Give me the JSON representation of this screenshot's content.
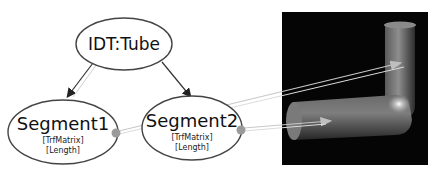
{
  "diagram": {
    "nodes": [
      {
        "id": "root",
        "title": "IDT:Tube",
        "fields": []
      },
      {
        "id": "seg1",
        "title": "Segment1",
        "fields": [
          "[TrfMatrix]",
          "[Length]"
        ]
      },
      {
        "id": "seg2",
        "title": "Segment2",
        "fields": [
          "[TrfMatrix]",
          "[Length]"
        ]
      }
    ],
    "edges": [
      {
        "from": "root",
        "to": "seg1"
      },
      {
        "from": "root",
        "to": "seg2"
      },
      {
        "from": "seg1",
        "to": "render-upper-segment"
      },
      {
        "from": "seg2",
        "to": "render-lower-segment"
      }
    ],
    "render": {
      "description": "3D rendered bent tube",
      "background": "#050505"
    },
    "colors": {
      "node_fill": "#ffffff",
      "node_stroke": "#444444",
      "edge": "#333333",
      "link": "#cfcfcf",
      "port": "#9a9a9a"
    }
  }
}
